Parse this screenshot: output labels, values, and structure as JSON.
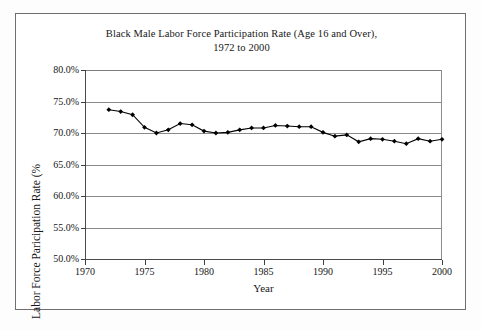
{
  "chart_data": {
    "type": "line",
    "title": "Black Male Labor Force Participation Rate (Age 16 and Over),",
    "subtitle": "1972 to 2000",
    "xlabel": "Year",
    "ylabel": "Labor Force Paricipation Rate (%",
    "xlim": [
      1970,
      2000
    ],
    "ylim": [
      50.0,
      80.0
    ],
    "grid": true,
    "legend": "none",
    "marker": "filled-diamond",
    "line_color": "#000000",
    "xticks": [
      "1970",
      "1975",
      "1980",
      "1985",
      "1990",
      "1995",
      "2000"
    ],
    "xtick_values": [
      1970,
      1975,
      1980,
      1985,
      1990,
      1995,
      2000
    ],
    "yticks": [
      "50.0%",
      "55.0%",
      "60.0%",
      "65.0%",
      "70.0%",
      "75.0%",
      "80.0%"
    ],
    "ytick_values": [
      50.0,
      55.0,
      60.0,
      65.0,
      70.0,
      75.0,
      80.0
    ],
    "x": [
      1972,
      1973,
      1974,
      1975,
      1976,
      1977,
      1978,
      1979,
      1980,
      1981,
      1982,
      1983,
      1984,
      1985,
      1986,
      1987,
      1988,
      1989,
      1990,
      1991,
      1992,
      1993,
      1994,
      1995,
      1996,
      1997,
      1998,
      1999,
      2000
    ],
    "values": [
      73.7,
      73.4,
      72.9,
      70.9,
      70.0,
      70.5,
      71.5,
      71.3,
      70.3,
      70.0,
      70.1,
      70.5,
      70.8,
      70.8,
      71.2,
      71.1,
      71.0,
      71.0,
      70.1,
      69.5,
      69.7,
      68.6,
      69.1,
      69.0,
      68.7,
      68.3,
      69.1,
      68.7,
      69.0
    ],
    "series": [
      {
        "name": "Black Male Labor Force Participation Rate",
        "values": [
          73.7,
          73.4,
          72.9,
          70.9,
          70.0,
          70.5,
          71.5,
          71.3,
          70.3,
          70.0,
          70.1,
          70.5,
          70.8,
          70.8,
          71.2,
          71.1,
          71.0,
          71.0,
          70.1,
          69.5,
          69.7,
          68.6,
          69.1,
          69.0,
          68.7,
          68.3,
          69.1,
          68.7,
          69.0
        ]
      }
    ]
  }
}
